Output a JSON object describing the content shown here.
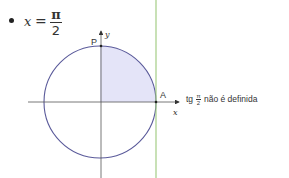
{
  "equation": {
    "bullet": "•",
    "variable": "x",
    "equals": "=",
    "numerator": "π",
    "denominator": "2"
  },
  "diagram": {
    "type": "unit circle",
    "center": [
      100,
      102
    ],
    "radius": 56,
    "labels": {
      "point_top": "P",
      "point_right": "A",
      "x_axis": "x",
      "y_axis": "y"
    },
    "colors": {
      "circle_stroke": "#5a5a9a",
      "shaded_fill": "#e4e4f8",
      "axis": "#444444",
      "tangent_line": "#9cc97a"
    },
    "shaded_region": "first quadrant sector (0 to π/2)"
  },
  "caption": {
    "prefix": "tg",
    "frac_num": "π",
    "frac_den": "2",
    "suffix": "não é definida"
  }
}
